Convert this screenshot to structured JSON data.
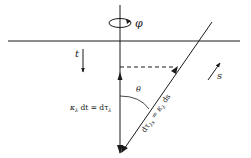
{
  "diagram": {
    "type": "geometry-vector-diagram",
    "colors": {
      "line": "#1a1a1a",
      "background": "#ffffff"
    },
    "labels": {
      "phi": "φ",
      "t": "t",
      "s": "s",
      "theta": "θ",
      "vertical_vector": "κ",
      "vertical_vector_sub": "λ",
      "vertical_vector_rest": " dt = dτ",
      "vertical_vector_sub2": "λ",
      "diagonal_vector_a": "dτ",
      "diagonal_vector_sub_a": "λs",
      "diagonal_vector_b": " = κ",
      "diagonal_vector_sub_b": "λ",
      "diagonal_vector_c": " ds"
    },
    "elements": [
      "surface-line",
      "vertical-axis",
      "rotation-arrow-phi",
      "direction-arrow-t",
      "direction-arrow-s",
      "slanted-ray",
      "dashed-projection",
      "angle-arc-theta",
      "vertical-vector",
      "diagonal-vector"
    ]
  }
}
